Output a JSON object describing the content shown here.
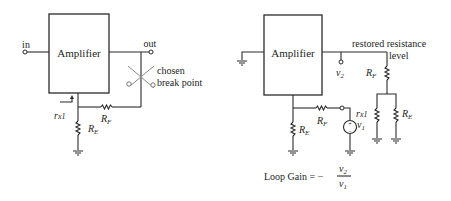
{
  "left_circuit": {
    "amplifier_label": "Amplifier",
    "input_label": "in",
    "output_label": "out",
    "break_label_line1": "chosen",
    "break_label_line2": "break point",
    "rx_label": "r",
    "rx_sub": "x1",
    "rf_label": "R",
    "rf_sub": "F",
    "re_label": "R",
    "re_sub": "E"
  },
  "right_circuit": {
    "amplifier_label": "Amplifier",
    "v2_label": "v",
    "v2_sub": "2",
    "restored_line1": "restored resistance",
    "restored_line2": "level",
    "rf_top_label": "R",
    "rf_top_sub": "F",
    "rf_label": "R",
    "rf_sub": "F",
    "re_label": "R",
    "re_sub": "E",
    "v1_label": "v",
    "v1_sub": "1",
    "source_plus": "+",
    "source_minus": "−",
    "rx_label": "r",
    "rx_sub": "x1",
    "re_right_label": "R",
    "re_right_sub": "E"
  },
  "equation": {
    "lhs": "Loop Gain = −",
    "numerator": "v",
    "numerator_sub": "2",
    "denominator": "v",
    "denominator_sub": "1"
  },
  "colors": {
    "line": "#2a2a2a",
    "break_point": "#888888",
    "background": "#ffffff"
  }
}
